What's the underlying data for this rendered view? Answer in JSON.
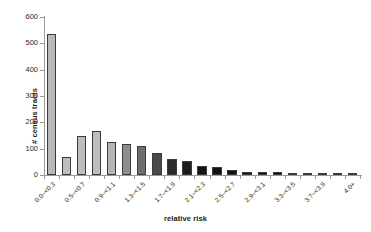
{
  "chart_data": {
    "type": "bar",
    "title": "",
    "xlabel": "relative risk",
    "ylabel": "# census tracts",
    "ylim": [
      0,
      600
    ],
    "yticks": [
      0,
      100,
      200,
      300,
      400,
      500,
      600
    ],
    "grid": false,
    "legend": "none",
    "label_step": 2,
    "categories": [
      "0.0-<0.3",
      "0.3-<0.5",
      "0.5-<0.7",
      "0.7-<0.9",
      "0.9-<1.1",
      "1.1-<1.3",
      "1.3-<1.5",
      "1.5-<1.7",
      "1.7-<1.9",
      "1.9-<2.1",
      "2.1-<2.3",
      "2.3-<2.5",
      "2.5-<2.7",
      "2.7-<2.9",
      "2.9-<3.1",
      "3.1-<3.3",
      "3.3-<3.5",
      "3.5-<3.7",
      "3.7-<3.9",
      "3.9-<4.0",
      "4.0+"
    ],
    "values": [
      535,
      67,
      150,
      168,
      126,
      118,
      112,
      84,
      61,
      55,
      35,
      32,
      18,
      13,
      11,
      11,
      2,
      1,
      2,
      1,
      5
    ],
    "bar_colors": [
      "#b9b9b9",
      "#bdbdbd",
      "#bdbdbd",
      "#bdbdbd",
      "#b5b5b5",
      "#8e8e8e",
      "#6e6e6e",
      "#4a4a4a",
      "#2a2a2a",
      "#1c1c1c",
      "#141414",
      "#121212",
      "#111111",
      "#111111",
      "#111111",
      "#111111",
      "#111111",
      "#111111",
      "#111111",
      "#111111",
      "#111111"
    ],
    "axis_color": "#9a9a9a",
    "text_color": "#1a1a1a"
  }
}
